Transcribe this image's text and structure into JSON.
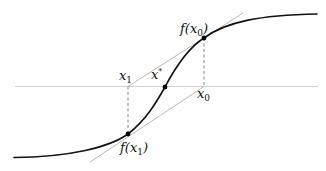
{
  "figure": {
    "colors": {
      "curve": "#111111",
      "axis": "#b8b8b8",
      "secant": "#9a9a9a",
      "dashed": "#555555",
      "point": "#000000",
      "background": "#ffffff"
    },
    "labels": {
      "f_x0": {
        "base": "f(x",
        "sub": "0",
        "close": ")"
      },
      "f_x1": {
        "base": "f(x",
        "sub": "1",
        "close": ")"
      },
      "x1": {
        "base": "x",
        "sub": "1"
      },
      "x0": {
        "base": "x",
        "sub": "0"
      },
      "xstar": {
        "base": "x",
        "sup": "*"
      }
    },
    "points": [
      {
        "name": "f(x0)",
        "x": 204,
        "y": 38
      },
      {
        "name": "f(x1)",
        "x": 128,
        "y": 134
      },
      {
        "name": "x*",
        "x": 165,
        "y": 87
      }
    ]
  }
}
